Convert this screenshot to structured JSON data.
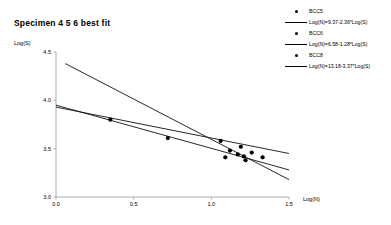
{
  "chart_data": {
    "type": "scatter",
    "title": "Specimen  4 5 6 best fit",
    "xlabel": "Log(N)",
    "ylabel": "Log(S)",
    "xlim": [
      0.0,
      1.5
    ],
    "ylim": [
      3.0,
      4.5
    ],
    "xticks": [
      "0.0",
      "0.5",
      "1.0",
      "1.5"
    ],
    "xtick_values": [
      0.0,
      0.5,
      1.0,
      1.5
    ],
    "yticks": [
      "4.5",
      "4.0",
      "3.5",
      "3.0"
    ],
    "ytick_values": [
      4.5,
      4.0,
      3.5,
      3.0
    ],
    "grid": false,
    "legend_position": "top-right",
    "series": [
      {
        "name": "BCC5",
        "marker": "filled-circle",
        "fit_label": "Log(N)=9.37-2.36*Log(S)",
        "fit_intercept": 9.37,
        "fit_slope": -2.36,
        "plotted_line": {
          "x": [
            0.0,
            1.5
          ],
          "y": [
            3.93,
            3.45
          ]
        },
        "points": [
          {
            "x": 0.35,
            "y": 3.8
          },
          {
            "x": 1.06,
            "y": 3.58
          },
          {
            "x": 1.19,
            "y": 3.52
          }
        ]
      },
      {
        "name": "BCC6",
        "marker": "filled-circle",
        "fit_label": "Log(N)=6.58-1.28*Log(S)",
        "fit_intercept": 6.58,
        "fit_slope": -1.28,
        "plotted_line": {
          "x": [
            0.0,
            1.5
          ],
          "y": [
            3.95,
            3.28
          ]
        },
        "points": [
          {
            "x": 0.72,
            "y": 3.61
          },
          {
            "x": 1.12,
            "y": 3.48
          },
          {
            "x": 1.17,
            "y": 3.44
          },
          {
            "x": 1.26,
            "y": 3.46
          }
        ]
      },
      {
        "name": "BCC8",
        "marker": "filled-circle",
        "fit_label": "Log(N)=13.18-3.37*Log(S)",
        "fit_intercept": 13.18,
        "fit_slope": -3.37,
        "plotted_line": {
          "x": [
            0.06,
            1.5
          ],
          "y": [
            4.38,
            3.18
          ]
        },
        "points": [
          {
            "x": 1.09,
            "y": 3.41
          },
          {
            "x": 1.21,
            "y": 3.42
          },
          {
            "x": 1.22,
            "y": 3.38
          },
          {
            "x": 1.33,
            "y": 3.41
          }
        ]
      }
    ],
    "all_points": [
      {
        "x": 0.35,
        "y": 3.8
      },
      {
        "x": 0.72,
        "y": 3.61
      },
      {
        "x": 1.06,
        "y": 3.58
      },
      {
        "x": 1.09,
        "y": 3.41
      },
      {
        "x": 1.12,
        "y": 3.48
      },
      {
        "x": 1.17,
        "y": 3.44
      },
      {
        "x": 1.19,
        "y": 3.52
      },
      {
        "x": 1.21,
        "y": 3.42
      },
      {
        "x": 1.22,
        "y": 3.38
      },
      {
        "x": 1.26,
        "y": 3.46
      },
      {
        "x": 1.33,
        "y": 3.41
      }
    ],
    "colors": {
      "axis": "#9a9a9a",
      "line": "#111111",
      "marker": "#000000",
      "text": "#000000"
    }
  },
  "legend": {
    "rows": [
      {
        "kind": "marker",
        "label": "BCC5"
      },
      {
        "kind": "line",
        "label": "Log(N)=9.37-2.36*Log(S)"
      },
      {
        "kind": "marker",
        "label": "BCC6"
      },
      {
        "kind": "line",
        "label": "Log(N)=6.58-1.28*Log(S)"
      },
      {
        "kind": "marker",
        "label": "BCC8"
      },
      {
        "kind": "line",
        "label": "Log(N)=13.18-3.37*Log(S)"
      }
    ]
  }
}
